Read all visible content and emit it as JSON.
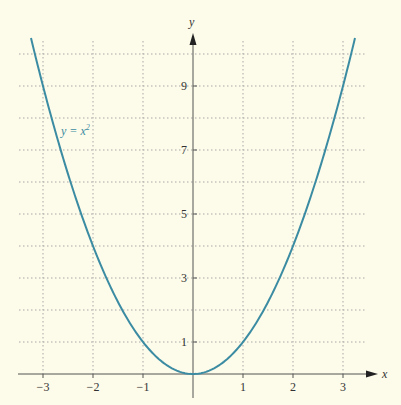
{
  "chart_data": {
    "type": "line",
    "title": "",
    "xlabel": "x",
    "ylabel": "y",
    "xlim": [
      -3.5,
      3.5
    ],
    "ylim": [
      0,
      10.6
    ],
    "grid": true,
    "grid_style": "dotted",
    "x_ticks": [
      -3,
      -2,
      -1,
      1,
      2,
      3
    ],
    "x_tick_labels": [
      "−3",
      "−2",
      "−1",
      "1",
      "2",
      "3"
    ],
    "y_ticks": [
      1,
      3,
      5,
      7,
      9
    ],
    "y_tick_labels": [
      "1",
      "3",
      "5",
      "7",
      "9"
    ],
    "y_grid": [
      1,
      2,
      3,
      4,
      5,
      6,
      7,
      8,
      9,
      10
    ],
    "x_grid": [
      -3,
      -2,
      -1,
      1,
      2,
      3
    ],
    "series": [
      {
        "name": "y = x²",
        "function": "x^2",
        "x": [
          -3.24,
          -3,
          -2.5,
          -2,
          -1.5,
          -1,
          -0.5,
          0,
          0.5,
          1,
          1.5,
          2,
          2.5,
          3,
          3.24
        ],
        "values": [
          10.5,
          9,
          6.25,
          4,
          2.25,
          1,
          0.25,
          0,
          0.25,
          1,
          2.25,
          4,
          6.25,
          9,
          10.5
        ],
        "color": "#3b8ca3"
      }
    ],
    "annotations": [
      {
        "text_main": "y = x",
        "text_sup": "2",
        "near": [
          -2.6,
          7.5
        ]
      }
    ],
    "legend": "none"
  },
  "colors": {
    "background": "#fdfbe9",
    "curve": "#3b8ca3",
    "axis": "#555555",
    "grid": "#a9a9a9",
    "text": "#333333"
  }
}
